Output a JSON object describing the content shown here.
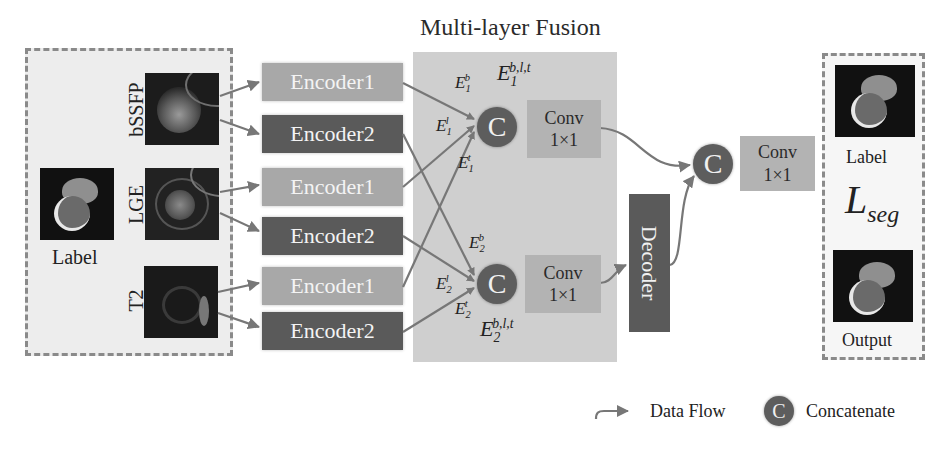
{
  "title": "Multi-layer Fusion",
  "inputs": {
    "modalities": [
      {
        "name": "bSSFP"
      },
      {
        "name": "LGE"
      },
      {
        "name": "T2"
      }
    ],
    "label_caption": "Label"
  },
  "encoders": [
    {
      "label": "Encoder1",
      "modality": "bSSFP"
    },
    {
      "label": "Encoder2",
      "modality": "bSSFP"
    },
    {
      "label": "Encoder1",
      "modality": "LGE"
    },
    {
      "label": "Encoder2",
      "modality": "LGE"
    },
    {
      "label": "Encoder1",
      "modality": "T2"
    },
    {
      "label": "Encoder2",
      "modality": "T2"
    }
  ],
  "fusion": {
    "concat_symbol": "C",
    "branch1": {
      "inputs": [
        {
          "base": "E",
          "sub": "1",
          "sup": "b"
        },
        {
          "base": "E",
          "sub": "1",
          "sup": "l"
        },
        {
          "base": "E",
          "sub": "1",
          "sup": "t"
        }
      ],
      "combined": {
        "base": "E",
        "sub": "1",
        "sup": "b,l,t"
      },
      "conv": {
        "line1": "Conv",
        "line2": "1×1"
      }
    },
    "branch2": {
      "inputs": [
        {
          "base": "E",
          "sub": "2",
          "sup": "b"
        },
        {
          "base": "E",
          "sub": "2",
          "sup": "l"
        },
        {
          "base": "E",
          "sub": "2",
          "sup": "t"
        }
      ],
      "combined": {
        "base": "E",
        "sub": "2",
        "sup": "b,l,t"
      },
      "conv": {
        "line1": "Conv",
        "line2": "1×1"
      }
    }
  },
  "decoder": {
    "label": "Decoder"
  },
  "final": {
    "concat_symbol": "C",
    "conv": {
      "line1": "Conv",
      "line2": "1×1"
    }
  },
  "outputs": {
    "label_caption": "Label",
    "loss": {
      "base": "L",
      "sub": "seg"
    },
    "output_caption": "Output"
  },
  "legend": {
    "data_flow": "Data Flow",
    "concat_symbol": "C",
    "concatenate": "Concatenate"
  },
  "colors": {
    "encoder1": "#a8a8a8",
    "encoder2": "#5a5a5a",
    "fusion_bg": "#cfcfcf",
    "concat": "#5d5d5d",
    "conv": "#b3b3b3",
    "arrow": "#777777"
  }
}
